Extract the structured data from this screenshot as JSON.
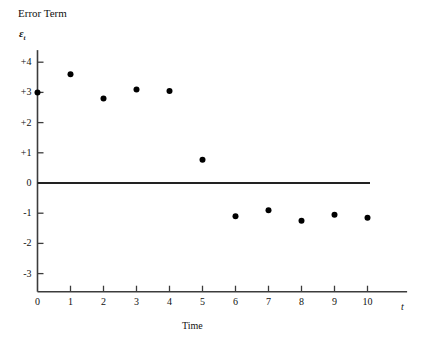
{
  "chart_data": {
    "type": "scatter",
    "title": "Error Term",
    "xlabel": "Time",
    "ylabel": "Error Term",
    "y_axis_symbol": "ε",
    "y_axis_symbol_sub": "t",
    "x_axis_symbol": "t",
    "x": [
      0,
      1,
      2,
      3,
      4,
      5,
      6,
      7,
      8,
      9,
      10
    ],
    "values": [
      3.0,
      3.6,
      2.8,
      3.1,
      3.05,
      0.77,
      -1.1,
      -0.9,
      -1.25,
      -1.05,
      -1.15
    ],
    "xlim": [
      0,
      11.2
    ],
    "ylim": [
      -3.6,
      4.4
    ],
    "xticks": [
      0,
      1,
      2,
      3,
      4,
      5,
      6,
      7,
      8,
      9,
      10
    ],
    "xtick_labels": [
      "0",
      "1",
      "2",
      "3",
      "4",
      "5",
      "6",
      "7",
      "8",
      "9",
      "10"
    ],
    "yticks": [
      4,
      3,
      2,
      1,
      0,
      -1,
      -2,
      -3
    ],
    "ytick_labels": [
      "+4",
      "+3",
      "+2",
      "+1",
      "0",
      "-1",
      "-2",
      "-3"
    ],
    "grid": false,
    "legend": null,
    "zero_line": true,
    "marker": "filled-circle",
    "marker_color": "#000000",
    "axis_color": "#3c3c3c"
  }
}
